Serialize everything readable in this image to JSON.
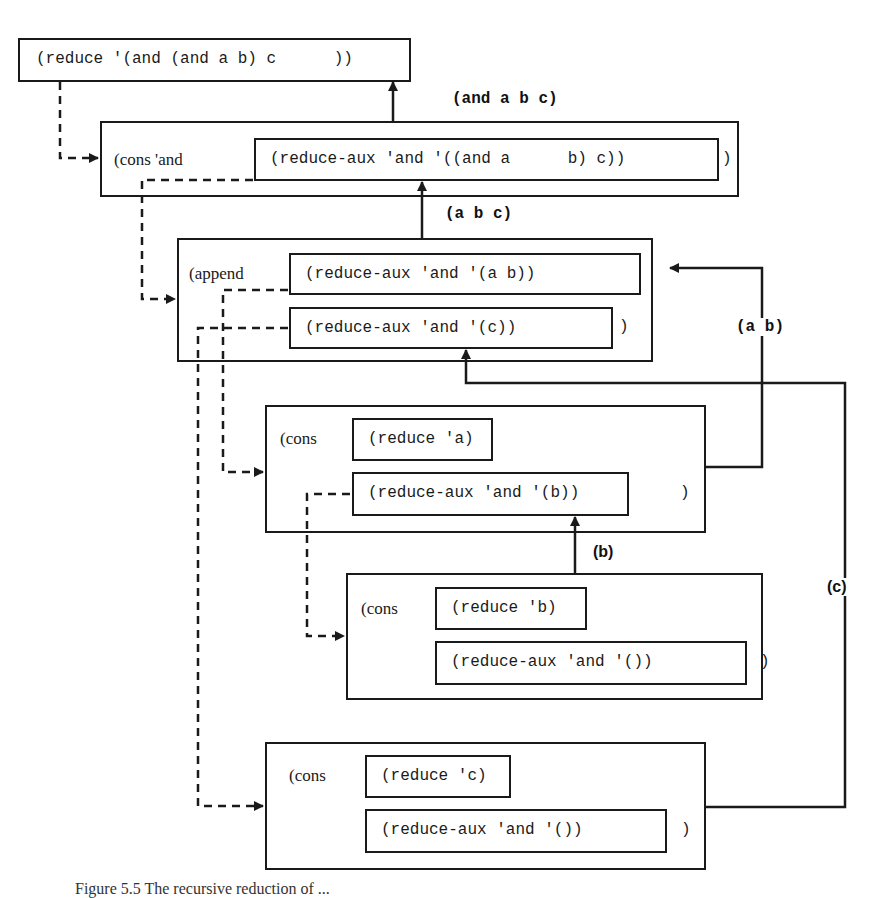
{
  "diagram": {
    "top_call": {
      "text": "(reduce '(and (and a b) c      ))"
    },
    "cons_and": {
      "prefix": "(cons 'and",
      "inner": "(reduce-aux 'and '((and a      b) c))",
      "close": ")"
    },
    "append": {
      "prefix": "(append",
      "inner1": "(reduce-aux 'and '(a b))",
      "inner2": "(reduce-aux 'and '(c))",
      "close": ")"
    },
    "cons_a": {
      "prefix": "(cons",
      "inner1": "(reduce 'a)",
      "inner2": "(reduce-aux 'and '(b))",
      "close": ")"
    },
    "cons_b": {
      "prefix": "(cons",
      "inner1": "(reduce 'b)",
      "inner2": "(reduce-aux 'and '())",
      "close": ")"
    },
    "cons_c": {
      "prefix": "(cons",
      "inner1": "(reduce 'c)",
      "inner2": "(reduce-aux 'and '())",
      "close": ")"
    },
    "return_labels": {
      "and_abc": "(and a b c)",
      "abc": "(a b c)",
      "ab": "(a b)",
      "b": "(b)",
      "c": "(c)"
    },
    "caption": "Figure 5.5 The recursive reduction of ..."
  }
}
